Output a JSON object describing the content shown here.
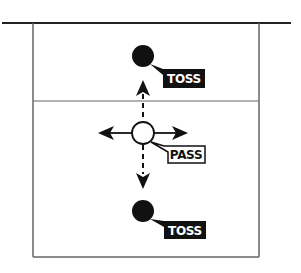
{
  "diagram": {
    "type": "volleyball-drill",
    "court": {
      "outer_line_color": "#222222",
      "net_line_color": "#555555"
    },
    "players": [
      {
        "id": "top-tosser",
        "role": "toss",
        "label": "TOSS",
        "style": "filled",
        "color": "#111111"
      },
      {
        "id": "passer",
        "role": "pass",
        "label": "PASS",
        "style": "open",
        "color": "#111111"
      },
      {
        "id": "bottom-tosser",
        "role": "toss",
        "label": "TOSS",
        "style": "filled",
        "color": "#111111"
      }
    ],
    "movements": [
      {
        "from": "passer",
        "direction": "up",
        "line": "dashed"
      },
      {
        "from": "passer",
        "direction": "down",
        "line": "dashed"
      },
      {
        "from": "passer",
        "direction": "left",
        "line": "solid"
      },
      {
        "from": "passer",
        "direction": "right",
        "line": "solid"
      }
    ],
    "labels": {
      "top_toss": "TOSS",
      "pass": "PASS",
      "bottom_toss": "TOSS"
    }
  }
}
